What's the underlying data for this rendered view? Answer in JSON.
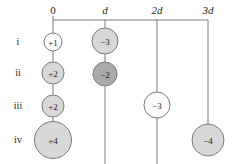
{
  "figure": {
    "width": 237,
    "height": 164,
    "background": "#ffffff",
    "line_color": "#7b7b7b",
    "text_color": "#231f20"
  },
  "axis": {
    "y": 20,
    "x_start": 53,
    "x_end": 208,
    "labels": [
      {
        "text": "0",
        "x": 53,
        "y": 16,
        "italic": false
      },
      {
        "text": "d",
        "x": 105,
        "y": 16,
        "italic": true
      },
      {
        "text": "2d",
        "x": 157,
        "y": 16,
        "italic": true
      },
      {
        "text": "3d",
        "x": 208,
        "y": 16,
        "italic": true
      }
    ]
  },
  "rows": [
    {
      "label": "i",
      "x": 18,
      "y": 42
    },
    {
      "label": "ii",
      "x": 18,
      "y": 73
    },
    {
      "label": "iii",
      "x": 18,
      "y": 106
    },
    {
      "label": "iv",
      "x": 18,
      "y": 140
    }
  ],
  "columns": [
    {
      "name": "column-0",
      "x": 53,
      "line_bottom": 141
    },
    {
      "name": "column-d",
      "x": 105,
      "line_bottom": 164
    },
    {
      "name": "column-2d",
      "x": 157,
      "line_bottom": 164
    },
    {
      "name": "column-3d",
      "x": 208,
      "line_bottom": 141
    }
  ],
  "colors": {
    "white_fill": "#fdfdfd",
    "light_gray_fill": "#d8d8d8",
    "dark_gray_fill": "#aaaaaa",
    "stroke": "#7b7b7b"
  },
  "charges": [
    {
      "id": "charge-i-0",
      "label": "+1",
      "row": "i",
      "column": "0",
      "cx": 53,
      "cy": 42,
      "r": 9,
      "fill": "#fdfdfd"
    },
    {
      "id": "charge-i-d",
      "label": "−3",
      "row": "i",
      "column": "d",
      "cx": 105,
      "cy": 41,
      "r": 13,
      "fill": "#d8d8d8"
    },
    {
      "id": "charge-ii-0",
      "label": "+2",
      "row": "ii",
      "column": "0",
      "cx": 53,
      "cy": 73,
      "r": 11,
      "fill": "#d8d8d8"
    },
    {
      "id": "charge-ii-d",
      "label": "−2",
      "row": "ii",
      "column": "d",
      "cx": 105,
      "cy": 74,
      "r": 12,
      "fill": "#aaaaaa"
    },
    {
      "id": "charge-iii-0",
      "label": "+2",
      "row": "iii",
      "column": "0",
      "cx": 53,
      "cy": 106,
      "r": 11,
      "fill": "#d8d8d8"
    },
    {
      "id": "charge-iii-2d",
      "label": "−3",
      "row": "iii",
      "column": "2d",
      "cx": 157,
      "cy": 105,
      "r": 13,
      "fill": "#fdfdfd"
    },
    {
      "id": "charge-iv-0",
      "label": "+4",
      "row": "iv",
      "column": "0",
      "cx": 53,
      "cy": 140,
      "r": 18.5,
      "fill": "#d8d8d8"
    },
    {
      "id": "charge-iv-3d",
      "label": "−4",
      "row": "iv",
      "column": "3d",
      "cx": 208,
      "cy": 140,
      "r": 16,
      "fill": "#d8d8d8"
    }
  ]
}
